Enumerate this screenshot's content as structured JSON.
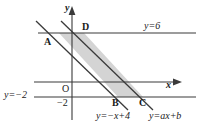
{
  "figure": {
    "type": "coordinate-geometry-diagram",
    "axes": {
      "x_axis_label": "x",
      "y_axis_label": "y",
      "origin_label": "O",
      "y_tick_label": "−2"
    },
    "lines": [
      {
        "id": "line-y6",
        "label": "y=6",
        "kind": "horizontal",
        "value": 6
      },
      {
        "id": "line-yneg2",
        "label": "y=−2",
        "kind": "horizontal",
        "value": -2
      },
      {
        "id": "line-left",
        "label": "y=−x+4",
        "kind": "oblique",
        "slope": -1,
        "intercept": 4
      },
      {
        "id": "line-right",
        "label": "y=ax+b",
        "kind": "oblique",
        "slope": -1,
        "intercept": "b"
      }
    ],
    "points": [
      {
        "id": "A",
        "label": "A"
      },
      {
        "id": "B",
        "label": "B"
      },
      {
        "id": "C",
        "label": "C"
      },
      {
        "id": "D",
        "label": "D"
      }
    ],
    "shaded_region": {
      "name": "parallelogram-ABCD",
      "fill": "#d4d4d4"
    },
    "colors": {
      "stroke": "#3a3a3a",
      "shade": "#d4d4d4",
      "text": "#1a1a1a",
      "background": "#ffffff"
    }
  }
}
